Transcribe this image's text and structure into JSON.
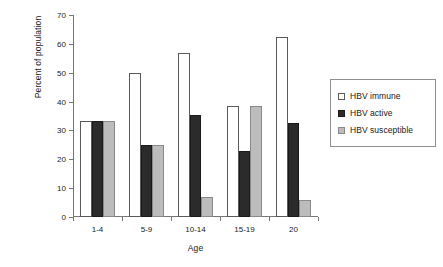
{
  "chart_data": {
    "type": "bar",
    "title": "",
    "xlabel": "Age",
    "ylabel": "Percent of population",
    "categories": [
      "1-4",
      "5-9",
      "10-14",
      "15-19",
      "20"
    ],
    "series": [
      {
        "name": "HBV immune",
        "color": "#ffffff",
        "values": [
          33.3,
          50.0,
          57.0,
          38.3,
          62.5
        ]
      },
      {
        "name": "HBV active",
        "color": "#2b2b2b",
        "values": [
          33.3,
          25.0,
          35.5,
          23.0,
          32.5
        ]
      },
      {
        "name": "HBV susceptible",
        "color": "#bcbcbc",
        "values": [
          33.3,
          25.0,
          7.0,
          38.3,
          6.0
        ]
      }
    ],
    "ylim": [
      0,
      70
    ],
    "ytick_step": 10,
    "yticks": [
      0,
      10,
      20,
      30,
      40,
      50,
      60,
      70
    ],
    "ytick_labels": [
      "0",
      "10",
      "20",
      "30",
      "40",
      "50",
      "60",
      "70"
    ],
    "grid": false,
    "legend_position": "right",
    "axis_color": "#767676",
    "text_color": "#1a1a1a",
    "background": "#ffffff"
  },
  "legend": {
    "items": [
      {
        "label": "HBV immune",
        "swatch": "immune"
      },
      {
        "label": "HBV active",
        "swatch": "active"
      },
      {
        "label": "HBV susceptible",
        "swatch": "susceptible"
      }
    ]
  }
}
